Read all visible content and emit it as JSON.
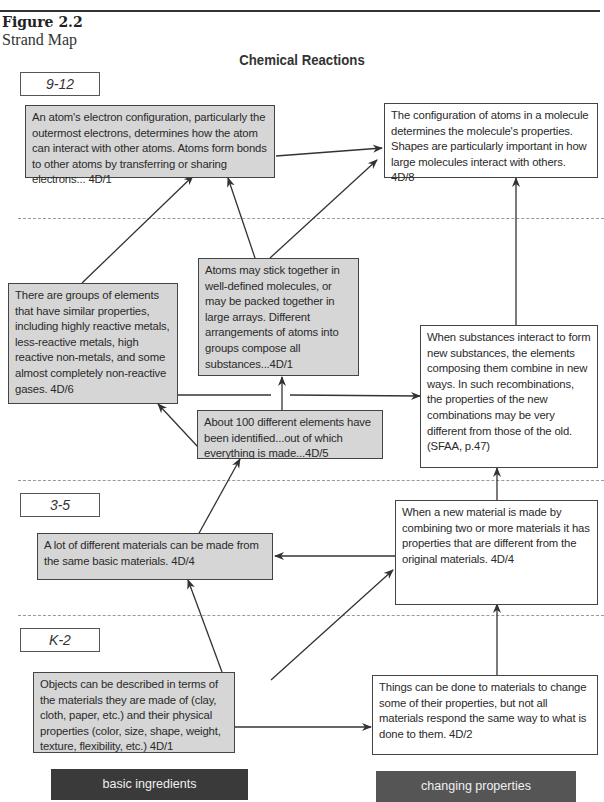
{
  "header": {
    "figure_label": "Figure 2.2",
    "figure_subtitle": "Strand Map",
    "title": "Chemical Reactions"
  },
  "grade_bands": [
    {
      "label": "9-12"
    },
    {
      "label": "6-8"
    },
    {
      "label": "3-5"
    },
    {
      "label": "K-2"
    }
  ],
  "nodes": {
    "n912_electron": {
      "text": "An atom's electron configuration, particularly the outermost electrons, determines how the atom can interact with other atoms. Atoms form bonds to other atoms by transferring or sharing electrons... 4D/1",
      "style": "shaded",
      "band": "9-12"
    },
    "n912_molecule": {
      "text": "The configuration of atoms in a molecule determines the molecule's properties. Shapes are particularly important in how large molecules interact with others. 4D/8",
      "style": "plain",
      "band": "9-12"
    },
    "n68_groups": {
      "text": "There are groups of elements that have similar properties, including highly reactive metals, less-reactive metals, high reactive non-metals, and some almost completely non-reactive gases. 4D/6",
      "style": "shaded",
      "band": "6-8"
    },
    "n68_atoms": {
      "text": "Atoms may stick together in well-defined molecules, or may be packed together in large arrays. Different arrangements of atoms into groups compose all substances...4D/1",
      "style": "shaded",
      "band": "6-8"
    },
    "n68_substances": {
      "text": "When substances interact to form new substances, the elements composing them combine in new ways. In such recombinations, the properties of the new combinations may be very different from those of the old. (SFAA, p.47)",
      "style": "plain",
      "band": "6-8"
    },
    "n68_elements": {
      "text": "About 100 different elements have been identified...out of which everything is made...4D/5",
      "style": "shaded",
      "band": "6-8"
    },
    "n35_materials": {
      "text": "A lot of different materials can be made from the same basic materials. 4D/4",
      "style": "shaded",
      "band": "3-5"
    },
    "n35_new_material": {
      "text": "When a new material is made by combining two or more materials it has properties that are different from the original materials. 4D/4",
      "style": "plain",
      "band": "3-5"
    },
    "nk2_objects": {
      "text": "Objects can be described in terms of the materials they are made of (clay, cloth, paper, etc.) and their physical properties (color, size, shape, weight, texture, flexibility, etc.) 4D/1",
      "style": "shaded",
      "band": "K-2"
    },
    "nk2_things": {
      "text": "Things can be done to materials to change some of their properties, but not all materials respond the same way to what is done to them. 4D/2",
      "style": "plain",
      "band": "K-2"
    }
  },
  "edges": [
    {
      "from": "n912_electron",
      "to": "n912_molecule"
    },
    {
      "from": "n68_groups",
      "to": "n912_electron"
    },
    {
      "from": "n68_atoms",
      "to": "n912_electron"
    },
    {
      "from": "n68_atoms",
      "to": "n912_molecule"
    },
    {
      "from": "n68_substances",
      "to": "n912_molecule"
    },
    {
      "from": "n68_groups",
      "to": "n68_substances"
    },
    {
      "from": "n68_elements",
      "to": "n68_atoms"
    },
    {
      "from": "n68_elements",
      "to": "n68_groups"
    },
    {
      "from": "n35_materials",
      "to": "n68_elements"
    },
    {
      "from": "n35_new_material",
      "to": "n68_substances"
    },
    {
      "from": "n35_new_material",
      "to": "n35_materials"
    },
    {
      "from": "nk2_objects",
      "to": "n35_materials"
    },
    {
      "from": "nk2_objects",
      "to": "n35_new_material"
    },
    {
      "from": "nk2_objects",
      "to": "nk2_things"
    },
    {
      "from": "nk2_things",
      "to": "n35_new_material"
    }
  ],
  "legend": {
    "left": {
      "label": "basic ingredients",
      "color": "#3a3a3a"
    },
    "right": {
      "label": "changing properties",
      "color": "#555555"
    }
  },
  "colors": {
    "shaded_box": "#d6d6d6",
    "border": "#444444",
    "dashed_divider": "#999999"
  }
}
